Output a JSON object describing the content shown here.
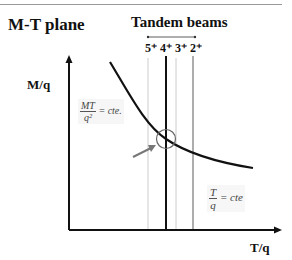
{
  "title": "M-T plane",
  "tandem": {
    "label": "Tandem beams"
  },
  "beam_labels": "5⁺ 4⁺ 3⁺ 2⁺",
  "axes": {
    "y": "M/q",
    "x": "T/q"
  },
  "formula_mt": {
    "num": "MT",
    "den": "q²",
    "rhs": "= cte."
  },
  "formula_t": {
    "num": "T",
    "den": "q",
    "rhs": "= cte"
  },
  "colors": {
    "line": "#111111",
    "faint": "#bbbbbb",
    "arrow": "#777777"
  }
}
